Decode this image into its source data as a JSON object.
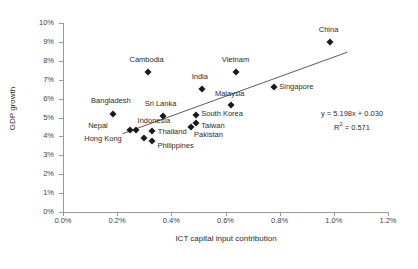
{
  "chart_data": {
    "type": "scatter",
    "title": "",
    "xlabel": "ICT capital input contribution",
    "ylabel": "GDP growth",
    "xlim": [
      0,
      1.2
    ],
    "ylim": [
      0,
      10
    ],
    "xtick_labels": [
      "0.0%",
      "0.2%",
      "0.4%",
      "0.6%",
      "0.8%",
      "1.0%",
      "1.2%"
    ],
    "ytick_labels": [
      "0%",
      "1%",
      "2%",
      "3%",
      "4%",
      "5%",
      "6%",
      "7%",
      "8%",
      "9%",
      "10%"
    ],
    "grid": false,
    "legend": "none",
    "marker": "diamond",
    "marker_color": "#1a1a1a",
    "trendline": {
      "equation": "y = 5.198x + 0.030",
      "r_squared_label": "R",
      "r_squared_sup": "2",
      "r_squared_value": " = 0.571",
      "slope": 5.198,
      "intercept": 0.03,
      "x_start": 0.22,
      "x_end": 1.05,
      "color": "#4a4a4a"
    },
    "points": [
      {
        "name": "Bangladesh",
        "x": 0.185,
        "y": 5.2,
        "lx": -2,
        "ly": -13,
        "anchor": "center"
      },
      {
        "name": "Nepal",
        "x": 0.248,
        "y": 4.35,
        "lx": -22,
        "ly": -4,
        "anchor": "right"
      },
      {
        "name": "Indonesia",
        "x": 0.268,
        "y": 4.35,
        "lx": 2,
        "ly": -9,
        "anchor": "left"
      },
      {
        "name": "Hong Kong",
        "x": 0.3,
        "y": 3.9,
        "lx": -22,
        "ly": 1,
        "anchor": "right"
      },
      {
        "name": "Cambodia",
        "x": 0.312,
        "y": 7.4,
        "lx": -1,
        "ly": -12,
        "anchor": "center"
      },
      {
        "name": "Philippines",
        "x": 0.33,
        "y": 3.76,
        "lx": 5,
        "ly": 5,
        "anchor": "left"
      },
      {
        "name": "Thailand",
        "x": 0.328,
        "y": 4.3,
        "lx": 6,
        "ly": 1,
        "anchor": "left"
      },
      {
        "name": "Sri Lanka",
        "x": 0.368,
        "y": 5.1,
        "lx": -2,
        "ly": -12,
        "anchor": "center"
      },
      {
        "name": "South Korea",
        "x": 0.492,
        "y": 5.12,
        "lx": 5,
        "ly": -1,
        "anchor": "left"
      },
      {
        "name": "Taiwan",
        "x": 0.492,
        "y": 4.7,
        "lx": 5,
        "ly": 3,
        "anchor": "left"
      },
      {
        "name": "Pakistan",
        "x": 0.473,
        "y": 4.48,
        "lx": 3,
        "ly": 8,
        "anchor": "left"
      },
      {
        "name": "India",
        "x": 0.512,
        "y": 6.5,
        "lx": -2,
        "ly": -12,
        "anchor": "center"
      },
      {
        "name": "Malaysia",
        "x": 0.62,
        "y": 5.65,
        "lx": -1,
        "ly": -11,
        "anchor": "center"
      },
      {
        "name": "Vietnam",
        "x": 0.64,
        "y": 7.4,
        "lx": -1,
        "ly": -12,
        "anchor": "center"
      },
      {
        "name": "Singapore",
        "x": 0.78,
        "y": 6.6,
        "lx": 5,
        "ly": 0,
        "anchor": "left"
      },
      {
        "name": "China",
        "x": 0.985,
        "y": 9.0,
        "lx": -1,
        "ly": -12,
        "anchor": "center"
      }
    ]
  }
}
